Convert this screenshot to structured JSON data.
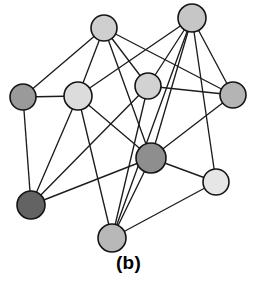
{
  "figure": {
    "caption": "(b)",
    "background_color": "#ffffff",
    "width": 257,
    "height": 282
  },
  "style": {
    "edge_color": "#1c1c1c",
    "edge_width": 1.35,
    "node_stroke_color": "#141414",
    "node_stroke_width": 1.6
  },
  "graph_data": {
    "type": "node-link-diagram",
    "directed": false,
    "node_count": 10,
    "edge_count": 23,
    "nodes": [
      {
        "id": "n1",
        "label": "",
        "cx": 104,
        "cy": 28,
        "r": 13,
        "fill": "#cfcfcf",
        "shade": "light-gray"
      },
      {
        "id": "n2",
        "label": "",
        "cx": 192,
        "cy": 18,
        "r": 14,
        "fill": "#c6c6c6",
        "shade": "light-gray"
      },
      {
        "id": "n3",
        "label": "",
        "cx": 23,
        "cy": 97,
        "r": 13,
        "fill": "#9a9a9a",
        "shade": "medium-gray"
      },
      {
        "id": "n4",
        "label": "",
        "cx": 78,
        "cy": 96,
        "r": 14,
        "fill": "#dcdcdc",
        "shade": "pale-gray"
      },
      {
        "id": "n5",
        "label": "",
        "cx": 148,
        "cy": 86,
        "r": 13,
        "fill": "#d2d2d2",
        "shade": "light-gray"
      },
      {
        "id": "n6",
        "label": "",
        "cx": 233,
        "cy": 95,
        "r": 13,
        "fill": "#b4b4b4",
        "shade": "medium-light-gray"
      },
      {
        "id": "n7",
        "label": "",
        "cx": 151,
        "cy": 158,
        "r": 15,
        "fill": "#8e8e8e",
        "shade": "dark-gray"
      },
      {
        "id": "n8",
        "label": "",
        "cx": 216,
        "cy": 182,
        "r": 13,
        "fill": "#e6e6e6",
        "shade": "very-light-gray"
      },
      {
        "id": "n9",
        "label": "",
        "cx": 31,
        "cy": 205,
        "r": 14,
        "fill": "#636363",
        "shade": "darkest-gray"
      },
      {
        "id": "n10",
        "label": "",
        "cx": 112,
        "cy": 238,
        "r": 14,
        "fill": "#b8b8b8",
        "shade": "medium-light-gray"
      }
    ],
    "edges": [
      {
        "source": "n1",
        "target": "n3"
      },
      {
        "source": "n1",
        "target": "n4"
      },
      {
        "source": "n1",
        "target": "n7"
      },
      {
        "source": "n1",
        "target": "n5"
      },
      {
        "source": "n1",
        "target": "n6"
      },
      {
        "source": "n2",
        "target": "n4"
      },
      {
        "source": "n2",
        "target": "n5"
      },
      {
        "source": "n2",
        "target": "n6"
      },
      {
        "source": "n2",
        "target": "n7"
      },
      {
        "source": "n2",
        "target": "n10"
      },
      {
        "source": "n2",
        "target": "n8"
      },
      {
        "source": "n3",
        "target": "n4"
      },
      {
        "source": "n3",
        "target": "n9"
      },
      {
        "source": "n4",
        "target": "n9"
      },
      {
        "source": "n4",
        "target": "n10"
      },
      {
        "source": "n4",
        "target": "n7"
      },
      {
        "source": "n5",
        "target": "n6"
      },
      {
        "source": "n5",
        "target": "n9"
      },
      {
        "source": "n5",
        "target": "n10"
      },
      {
        "source": "n6",
        "target": "n7"
      },
      {
        "source": "n7",
        "target": "n9"
      },
      {
        "source": "n7",
        "target": "n10"
      },
      {
        "source": "n7",
        "target": "n8"
      },
      {
        "source": "n8",
        "target": "n10"
      }
    ]
  }
}
